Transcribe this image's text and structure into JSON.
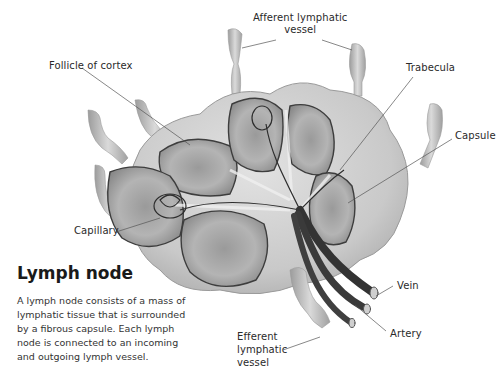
{
  "diagram": {
    "labels": {
      "afferent_line1": "Afferent lymphatic",
      "afferent_line2": "vessel",
      "follicle": "Follicle of cortex",
      "trabecula": "Trabecula",
      "capsule": "Capsule",
      "capillary": "Capillary",
      "vein": "Vein",
      "artery": "Artery",
      "efferent_line1": "Efferent",
      "efferent_line2": "lymphatic",
      "efferent_line3": "vessel"
    },
    "colors": {
      "tissue": "#b9b9b9",
      "capsule_fill": "#cfcfcf",
      "follicle_fill": "#a8a8a8",
      "vessel_dark": "#3a3a3a",
      "leader_line": "#555555"
    }
  },
  "caption": {
    "title": "Lymph node",
    "body": "A lymph node consists of a mass of lymphatic tissue that is surrounded by a fibrous capsule. Each lymph node is connected to an incoming and outgoing lymph vessel."
  }
}
